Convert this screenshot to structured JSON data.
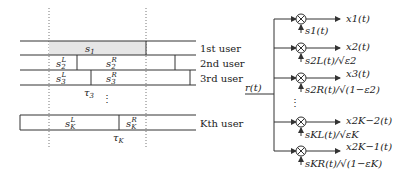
{
  "timeline": {
    "users": [
      {
        "label": "1st user",
        "segments": [
          "s1"
        ]
      },
      {
        "label": "2nd user",
        "segments": [
          "s2L",
          "s2R"
        ]
      },
      {
        "label": "3rd user",
        "segments": [
          "s3L",
          "s3R"
        ],
        "delay": "τ3"
      },
      {
        "label": "Kth user",
        "segments": [
          "sKL",
          "sKR"
        ],
        "delay": "τK"
      }
    ],
    "ellipsis": "⋮"
  },
  "receiver": {
    "input": "r(t)",
    "branches": [
      {
        "output": "x1(t)",
        "reference": "s1(t)"
      },
      {
        "output": "x2(t)",
        "reference": "s2L(t)/√ε2"
      },
      {
        "output": "x3(t)",
        "reference": "s2R(t)/√(1−ε2)"
      },
      {
        "output": "x2K−2(t)",
        "reference": "sKL(t)/√εK"
      },
      {
        "output": "x2K−1(t)",
        "reference": "sKR(t)/√(1−εK)"
      }
    ],
    "ellipsis": "⋮"
  },
  "colors": {
    "line": "#333333",
    "shade": "#e6e6e6",
    "dotted": "#777777"
  }
}
